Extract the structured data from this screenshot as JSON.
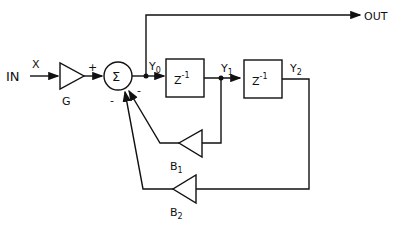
{
  "diagram": {
    "type": "second-order IIR filter block diagram",
    "input": {
      "label": "IN",
      "signal": "X"
    },
    "output": {
      "label": "OUT"
    },
    "gain": {
      "label": "G"
    },
    "summer": {
      "symbol": "Σ",
      "plus_sign": "+",
      "minus_sign_1": "-",
      "minus_sign_2": "-"
    },
    "delays": [
      {
        "label": "Z",
        "exponent": "-1"
      },
      {
        "label": "Z",
        "exponent": "-1"
      }
    ],
    "nodes": [
      {
        "label": "Y",
        "sub": "0"
      },
      {
        "label": "Y",
        "sub": "1"
      },
      {
        "label": "Y",
        "sub": "2"
      }
    ],
    "feedback": [
      {
        "label": "B",
        "sub": "1"
      },
      {
        "label": "B",
        "sub": "2"
      }
    ]
  }
}
